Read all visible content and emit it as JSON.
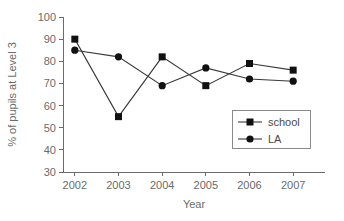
{
  "chart_data": {
    "type": "line",
    "title": "",
    "xlabel": "Year",
    "ylabel": "% of pupils at Level 3",
    "categories": [
      "2002",
      "2003",
      "2004",
      "2005",
      "2006",
      "2007"
    ],
    "x": [
      2002,
      2003,
      2004,
      2005,
      2006,
      2007
    ],
    "xlim": [
      2001.5,
      2007.5
    ],
    "ylim": [
      30,
      100
    ],
    "yticks": [
      30,
      40,
      50,
      60,
      70,
      80,
      90,
      100
    ],
    "ytick_labels": [
      "30",
      "40",
      "50",
      "60",
      "70",
      "80",
      "90",
      "100"
    ],
    "grid": false,
    "legend_position": "inside-bottom-right",
    "series": [
      {
        "name": "school",
        "marker": "square",
        "color": "#111111",
        "values": [
          90,
          55,
          82,
          69,
          79,
          76
        ]
      },
      {
        "name": "LA",
        "marker": "circle",
        "color": "#111111",
        "values": [
          85,
          82,
          69,
          77,
          72,
          71
        ]
      }
    ]
  },
  "legend": {
    "entries": [
      {
        "label": "school",
        "marker": "square"
      },
      {
        "label": "LA",
        "marker": "circle"
      }
    ]
  },
  "axes": {
    "x_title": "Year",
    "y_title": "% of pupils at Level 3"
  }
}
